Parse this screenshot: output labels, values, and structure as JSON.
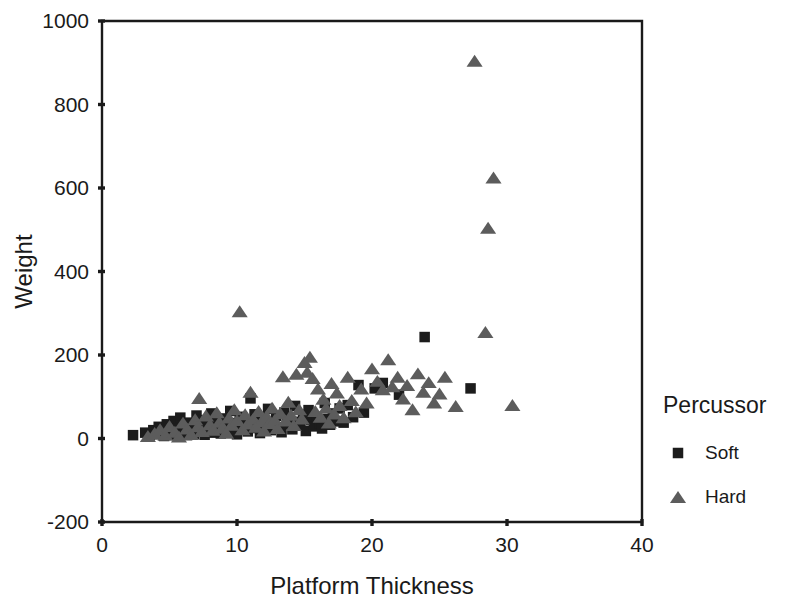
{
  "chart_data": {
    "type": "scatter",
    "title": "",
    "xlabel": "Platform Thickness",
    "ylabel": "Weight",
    "xlim": [
      0,
      40
    ],
    "ylim": [
      -200,
      1000
    ],
    "xticks": [
      0,
      10,
      20,
      30,
      40
    ],
    "yticks": [
      -200,
      0,
      200,
      400,
      600,
      800,
      1000
    ],
    "grid": false,
    "legend": {
      "title": "Percussor",
      "position": "right",
      "entries": [
        {
          "name": "Soft",
          "marker": "square",
          "color": "#1c1c1c"
        },
        {
          "name": "Hard",
          "marker": "triangle",
          "color": "#5c5c5c"
        }
      ]
    },
    "series": [
      {
        "name": "Soft",
        "marker": "square",
        "color": "#1c1c1c",
        "points": [
          [
            2.3,
            8
          ],
          [
            3.2,
            14
          ],
          [
            3.5,
            5
          ],
          [
            3.8,
            20
          ],
          [
            4.0,
            10
          ],
          [
            4.2,
            28
          ],
          [
            4.4,
            15
          ],
          [
            4.6,
            6
          ],
          [
            4.8,
            34
          ],
          [
            5.0,
            18
          ],
          [
            5.1,
            9
          ],
          [
            5.3,
            42
          ],
          [
            5.5,
            24
          ],
          [
            5.6,
            12
          ],
          [
            5.8,
            50
          ],
          [
            6.0,
            30
          ],
          [
            6.1,
            16
          ],
          [
            6.3,
            8
          ],
          [
            6.5,
            38
          ],
          [
            6.6,
            22
          ],
          [
            6.8,
            11
          ],
          [
            7.0,
            55
          ],
          [
            7.1,
            28
          ],
          [
            7.3,
            17
          ],
          [
            7.5,
            44
          ],
          [
            7.6,
            9
          ],
          [
            7.8,
            33
          ],
          [
            8.0,
            21
          ],
          [
            8.1,
            60
          ],
          [
            8.3,
            14
          ],
          [
            8.5,
            39
          ],
          [
            8.6,
            26
          ],
          [
            8.8,
            12
          ],
          [
            9.0,
            48
          ],
          [
            9.1,
            31
          ],
          [
            9.3,
            19
          ],
          [
            9.5,
            66
          ],
          [
            9.6,
            37
          ],
          [
            9.8,
            23
          ],
          [
            10.0,
            10
          ],
          [
            10.2,
            52
          ],
          [
            10.4,
            29
          ],
          [
            10.6,
            41
          ],
          [
            10.8,
            17
          ],
          [
            11.0,
            96
          ],
          [
            11.1,
            35
          ],
          [
            11.3,
            58
          ],
          [
            11.5,
            25
          ],
          [
            11.7,
            13
          ],
          [
            11.9,
            45
          ],
          [
            12.1,
            30
          ],
          [
            12.3,
            71
          ],
          [
            12.5,
            20
          ],
          [
            12.7,
            38
          ],
          [
            12.9,
            54
          ],
          [
            13.1,
            27
          ],
          [
            13.3,
            15
          ],
          [
            13.5,
            62
          ],
          [
            13.7,
            35
          ],
          [
            13.9,
            46
          ],
          [
            14.1,
            22
          ],
          [
            14.3,
            78
          ],
          [
            14.5,
            40
          ],
          [
            14.7,
            31
          ],
          [
            14.9,
            57
          ],
          [
            15.1,
            18
          ],
          [
            15.3,
            68
          ],
          [
            15.5,
            44
          ],
          [
            15.7,
            29
          ],
          [
            15.9,
            52
          ],
          [
            16.1,
            36
          ],
          [
            16.3,
            24
          ],
          [
            16.5,
            85
          ],
          [
            16.7,
            47
          ],
          [
            16.9,
            33
          ],
          [
            17.1,
            60
          ],
          [
            17.3,
            41
          ],
          [
            17.6,
            72
          ],
          [
            17.9,
            38
          ],
          [
            18.2,
            80
          ],
          [
            18.6,
            51
          ],
          [
            19.0,
            128
          ],
          [
            19.4,
            62
          ],
          [
            20.2,
            120
          ],
          [
            20.8,
            133
          ],
          [
            22.0,
            105
          ],
          [
            23.9,
            243
          ],
          [
            27.3,
            120
          ]
        ]
      },
      {
        "name": "Hard",
        "marker": "triangle",
        "color": "#5c5c5c",
        "points": [
          [
            3.4,
            6
          ],
          [
            3.9,
            13
          ],
          [
            4.3,
            22
          ],
          [
            4.7,
            9
          ],
          [
            5.0,
            30
          ],
          [
            5.4,
            16
          ],
          [
            5.7,
            5
          ],
          [
            6.0,
            38
          ],
          [
            6.3,
            24
          ],
          [
            6.6,
            11
          ],
          [
            6.9,
            46
          ],
          [
            7.1,
            29
          ],
          [
            7.2,
            97
          ],
          [
            7.4,
            18
          ],
          [
            7.7,
            55
          ],
          [
            8.0,
            34
          ],
          [
            8.2,
            21
          ],
          [
            8.5,
            63
          ],
          [
            8.7,
            40
          ],
          [
            8.9,
            26
          ],
          [
            9.2,
            14
          ],
          [
            9.4,
            50
          ],
          [
            9.6,
            33
          ],
          [
            9.8,
            70
          ],
          [
            10.0,
            44
          ],
          [
            10.2,
            305
          ],
          [
            10.4,
            22
          ],
          [
            10.6,
            58
          ],
          [
            10.8,
            36
          ],
          [
            11.0,
            112
          ],
          [
            11.2,
            47
          ],
          [
            11.4,
            28
          ],
          [
            11.6,
            66
          ],
          [
            11.8,
            41
          ],
          [
            12.0,
            19
          ],
          [
            12.2,
            54
          ],
          [
            12.4,
            37
          ],
          [
            12.6,
            74
          ],
          [
            12.8,
            45
          ],
          [
            13.0,
            25
          ],
          [
            13.2,
            61
          ],
          [
            13.4,
            149
          ],
          [
            13.6,
            43
          ],
          [
            13.8,
            88
          ],
          [
            14.0,
            57
          ],
          [
            14.2,
            32
          ],
          [
            14.4,
            155
          ],
          [
            14.6,
            70
          ],
          [
            14.8,
            48
          ],
          [
            15.0,
            183
          ],
          [
            15.2,
            160
          ],
          [
            15.4,
            196
          ],
          [
            15.6,
            145
          ],
          [
            15.8,
            66
          ],
          [
            16.0,
            120
          ],
          [
            16.2,
            52
          ],
          [
            16.4,
            95
          ],
          [
            16.6,
            74
          ],
          [
            16.8,
            38
          ],
          [
            17.0,
            133
          ],
          [
            17.2,
            60
          ],
          [
            17.4,
            110
          ],
          [
            17.6,
            80
          ],
          [
            17.9,
            51
          ],
          [
            18.2,
            148
          ],
          [
            18.5,
            92
          ],
          [
            18.8,
            65
          ],
          [
            19.2,
            120
          ],
          [
            19.6,
            86
          ],
          [
            20.0,
            168
          ],
          [
            20.4,
            138
          ],
          [
            20.8,
            118
          ],
          [
            21.2,
            190
          ],
          [
            21.5,
            125
          ],
          [
            21.9,
            148
          ],
          [
            22.3,
            96
          ],
          [
            22.6,
            128
          ],
          [
            23.0,
            70
          ],
          [
            23.4,
            156
          ],
          [
            23.8,
            112
          ],
          [
            24.2,
            135
          ],
          [
            24.6,
            86
          ],
          [
            25.0,
            108
          ],
          [
            25.4,
            148
          ],
          [
            26.2,
            78
          ],
          [
            27.6,
            905
          ],
          [
            28.4,
            255
          ],
          [
            28.6,
            505
          ],
          [
            29.0,
            625
          ],
          [
            30.4,
            80
          ]
        ]
      }
    ]
  },
  "axes": {
    "y_label": "Weight",
    "x_label": "Platform Thickness",
    "y_ticks": [
      "1000",
      "800",
      "600",
      "400",
      "200",
      "0",
      "-200"
    ],
    "x_ticks": [
      "0",
      "10",
      "20",
      "30",
      "40"
    ]
  },
  "legend_block": {
    "title": "Percussor",
    "items": [
      {
        "label": "Soft"
      },
      {
        "label": "Hard"
      }
    ]
  }
}
